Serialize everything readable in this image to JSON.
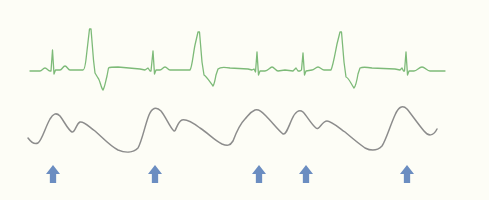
{
  "figure": {
    "width": 489,
    "height": 200,
    "background": "#fdfdf6"
  },
  "ecg_trace": {
    "label": "ECG waveform",
    "color": "#7dba78",
    "stroke_width": 1.3,
    "path": "M30,71 L40,71 C42,71 43,68 45,68 C47,68 48,71 50,71 L51,71 L52.5,50 L54,74 L55.5,70 L60,70 C62,70 63,66 65,66 C67,66 68,70 70,70 L83,70 C84.5,70 85.5,65 86.5,55 L89.5,29 L91,29 L93.5,60 L95,73 L98,78 C100,80 101,88 103,90 C104.5,88 105,84 107,76 L108.5,68 C110,67 113,67 118,67 L140,69 L145,70 L148,68 L150,71 L151,71 L153,51 L154.5,74 L156,70 L160,70 C162,70 163,67 165,67 C167,67 168,70 170,70 L190,70 C192,68 193,55 195,45 L198,32 L199.5,32 L202,62 L204,75 C207,77 210,82 213,86 C214.5,84 215,80 216,75 L218,69 C220,67 225,67 230,68 L248,69 L252,70 L254,69 L255.5,72 L257,52 L258.5,75 L260,71 L265,71 C268,71 270,67 272,67 C274,67 276,71 278,71 L285,70 L293,71 L296,68 L298,71 L300,71 L301.5,70 L303,53 L304.5,75 L306,71 L312,70 C314,70 316,67 318,67 C320,67 322,70 324,70 L331,70 C333,66 335,54 337,44 L340,32 L341.5,32 L344,62 L346,77 C349,78 351,84 354,88 C356,86 357,80 358,74 L360,68 C362,67 366,67 372,68 L395,69 L400,70 L402,68 L403.5,71 L404.5,71 L406,52 L407.5,75 L409,71 L414,71 C417,71 419,67 422,67 C425,67 427,71 430,71 L445,71"
  },
  "pulse_trace": {
    "label": "Pulse waveform",
    "color": "#8c8c8c",
    "stroke_width": 1.5,
    "path": "M28,138 C31,142 34,145 38,143 C42,140 45,128 50,119 C53,114 56,112 60,116 C64,121 68,130 72,132 C75,133 76,124 80,122 C84,121 88,126 95,131 C103,138 110,146 118,150 C125,153 133,153 138,148 C142,141 145,125 149,115 C152,108 156,106 161,111 C166,117 170,128 174,131 C176,132 177,122 182,120 C186,119 192,122 200,128 C208,133 214,140 222,144 C227,146 230,146 233,141 C236,133 240,124 245,119 C248,116 250,112 255,110 C259,109 262,112 266,116 C272,122 278,130 283,134 C286,135 288,128 292,119 C295,112 299,109 303,112 C307,116 311,124 316,128 C319,131 322,121 327,121 C331,121 338,127 345,132 C352,138 358,143 365,148 C371,151 377,151 382,146 C386,140 390,126 395,115 C398,108 402,104 407,109 C412,115 418,124 424,131 C428,136 433,137 437,129"
  },
  "markers": {
    "label": "Beat markers",
    "color": "#6b8dc1",
    "icon": "arrow-up-icon",
    "items": [
      {
        "x": 53,
        "label": "beat-1"
      },
      {
        "x": 155,
        "label": "beat-2"
      },
      {
        "x": 259,
        "label": "beat-3"
      },
      {
        "x": 306,
        "label": "beat-4"
      },
      {
        "x": 407,
        "label": "beat-5"
      }
    ],
    "top": 165,
    "height": 18,
    "width": 14
  }
}
